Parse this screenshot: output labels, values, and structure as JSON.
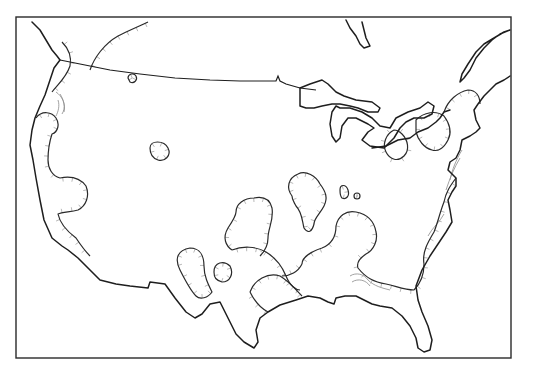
{
  "map": {
    "title": "",
    "type": "contour-map",
    "region": "contiguous-united-states",
    "width": 543,
    "height": 367,
    "colors": {
      "background": "#ffffff",
      "coastline": "#1e1e1e",
      "contour": "#2a2a2a",
      "inner_contour": "#8a8a8a",
      "hachure": "#9a9a9a",
      "frame": "#2a2a2a"
    },
    "frame": {
      "x": 16,
      "y": 17,
      "w": 495,
      "h": 341
    },
    "coastline": [
      "M32,22 L40,30 L46,40 L52,50 L57,56 L60,60 L54,68 L50,80 L45,95 L40,106 L35,118 L32,130 L30,145 L33,160 L36,178 L40,200 L44,220 L52,238 L62,246 L68,250 L78,258 L90,270 L100,280 L116,284 L130,286 L148,288 L150,282 L165,284 L175,298 L186,312 L195,318 L202,314 L210,304 L220,302 L228,318 L236,334 L244,342 L254,348 L258,342 L256,330 L260,318 L268,312 L280,305 L296,300 L308,296 L320,298 L328,302 L334,304 L336,298 L345,296 L356,296 L364,300 L372,304 L380,306 L392,308 L402,316 L410,326 L416,338 L418,348 L424,352 L430,350 L432,340 L428,326 L422,312 L418,300 L416,286 L422,270 L430,256 L438,244 L446,232 L452,222 L450,210 L448,200 L452,192 L456,186 L456,178 L448,170 L450,162 L456,158 L460,150 L462,140 L470,136 L476,132 L480,128 L476,120 L474,110 L478,104 L484,96 L490,90 L496,84 L504,80 L510,76",
      "M510,30 L500,34 L492,40 L484,48 L476,58 L470,70 L464,78 L460,82 L462,74 L468,64 L476,52 L484,44 L494,38 L504,32 Z",
      "M346,20 L350,28 L356,36 L360,44 L364,48 L370,46 L366,38 L364,30 L362,22"
    ],
    "border": "M60,60 L80,64 L110,70 L140,74 L175,78 L210,80 L240,81 L276,81 L278,76 L280,81 L286,84 L300,88 L316,90",
    "great_lakes": [
      "M300,88 L310,84 L322,80 L328,84 L334,90 L336,92 L344,96 L356,100 L372,102 L380,108 L378,112 L368,112 L358,108 L350,106 L340,104 L332,104 L322,106 L314,108 L306,108 L300,106 Z",
      "M336,106 L332,112 L330,124 L332,136 L336,142 L340,138 L342,126 L348,118 L356,118 L368,124 L374,128 L368,132 L362,140 L370,146 L384,148 L394,138 L400,128 L406,122 L414,118 L424,118 L432,114 L434,106 L428,102 L420,108 L408,112 L396,118 L390,128 L380,126 L372,118 L362,112 L350,108 L340,108 Z",
      "M372,148 L386,146 L398,140 L410,138 L418,132 L428,128 L436,122 L440,118 L444,112 L450,110"
    ],
    "contours_main": [
      "M36,118 C42,110 52,112 56,118 C60,124 58,132 52,134 C50,140 48,150 48,160 C48,168 52,176 60,178 C70,176 80,178 86,186 C90,196 86,206 78,210 C70,212 62,212 58,214 C60,224 68,232 76,238 C80,244 84,250 90,256",
      "M90,70 C94,58 104,44 118,36 C130,30 140,26 148,22",
      "M52,92 C58,84 66,78 70,66 C72,56 68,48 62,42",
      "M150,148 C150,140 164,140 168,148 C172,156 164,162 158,160 C152,158 150,154 150,148 Z",
      "M128,78 C128,74 134,72 136,76 C138,80 134,84 130,82 Z",
      "M180,270 C174,258 178,250 190,248 C200,248 204,256 204,266 C204,276 208,284 212,292 C208,298 200,300 196,296 C190,290 186,282 180,270 Z",
      "M214,272 C214,262 224,260 230,266 C234,274 230,282 222,282 C216,280 214,278 214,272 Z",
      "M232,250 C242,246 256,246 266,252 C276,258 282,266 286,276 C290,286 296,290 300,290",
      "M250,292 C254,280 268,272 280,276 C290,282 296,290 302,296",
      "M250,292 C254,300 260,308 268,312",
      "M236,212 C236,204 244,198 254,198 C264,196 270,200 272,208 C274,220 268,228 268,238 C268,246 264,252 260,256",
      "M232,250 C226,246 222,238 228,228 C232,222 236,216 236,212",
      "M292,196 C286,188 288,178 298,174 C306,170 316,176 320,184 C326,192 328,198 324,206 C320,214 314,218 314,224 C312,232 308,234 304,228 C302,220 302,212 296,206 C294,202 292,200 292,196 Z",
      "M340,190 C340,184 346,184 348,190 C350,196 346,200 342,198 C340,196 340,192 340,190 Z",
      "M354,196 C354,192 360,192 360,196 C360,200 354,200 354,196 Z",
      "M302,264 C302,258 310,252 322,248 C332,244 336,236 336,226 C338,216 346,210 356,212 C366,214 374,220 376,232 C378,240 374,250 366,254 C360,258 356,262 358,268 C366,278 374,282 386,284 C396,286 404,290 414,290",
      "M414,290 C420,284 424,276 424,264 C422,252 428,242 434,232 C438,222 440,212 444,202 C446,192 450,186 456,178",
      "M302,264 C298,272 290,276 282,276",
      "M394,130 C386,134 382,144 386,152 C390,160 398,162 404,156 C410,150 408,140 402,134 C400,132 398,130 394,130 Z",
      "M416,120 C424,112 436,110 444,116 C450,124 452,132 448,140 C444,148 438,152 432,150 C424,148 418,140 416,132 Z",
      "M444,112 C448,100 458,92 468,90 C476,90 480,96 480,104"
    ],
    "contours_inner": [
      "M56,92 C62,96 66,104 64,112 M60,94 C64,100 66,108 62,114 M58,100 C60,106 58,112 56,116",
      "M450,180 C452,170 456,160 462,150 M446,190 C450,178 454,168 460,158",
      "M428,236 C432,228 440,222 444,214",
      "M350,276 C356,272 364,274 368,280 C374,286 382,288 390,290 M352,282 C358,278 366,280 370,286"
    ],
    "hachure_spacing": 10
  }
}
